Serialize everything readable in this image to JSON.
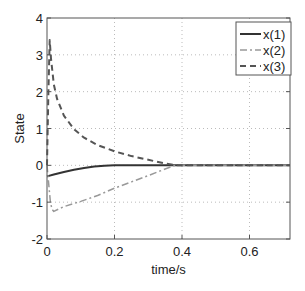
{
  "chart_data": {
    "type": "line",
    "title": "",
    "xlabel": "time/s",
    "ylabel": "State",
    "xlim": [
      0,
      0.72
    ],
    "ylim": [
      -2,
      4
    ],
    "xticks": [
      0,
      0.2,
      0.4,
      0.6
    ],
    "xtick_labels": [
      "0",
      "0.2",
      "0.4",
      "0.6"
    ],
    "yticks": [
      -2,
      -1,
      0,
      1,
      2,
      3,
      4
    ],
    "ytick_labels": [
      "-2",
      "-1",
      "0",
      "1",
      "2",
      "3",
      "4"
    ],
    "grid": true,
    "legend_position": "upper right",
    "series": [
      {
        "name": "x(1)",
        "style": "solid",
        "color": "#333333",
        "x": [
          0,
          0.02,
          0.05,
          0.08,
          0.11,
          0.14,
          0.17,
          0.2,
          0.25,
          0.3,
          0.4,
          0.5,
          0.6,
          0.72
        ],
        "y": [
          -0.3,
          -0.25,
          -0.18,
          -0.12,
          -0.07,
          -0.03,
          -0.01,
          0,
          0,
          0,
          0,
          0,
          0,
          0
        ]
      },
      {
        "name": "x(2)",
        "style": "dashdot",
        "color": "#999999",
        "x": [
          0,
          0.005,
          0.01,
          0.015,
          0.02,
          0.05,
          0.1,
          0.15,
          0.2,
          0.25,
          0.3,
          0.35,
          0.38,
          0.45,
          0.6,
          0.72
        ],
        "y": [
          0,
          -0.5,
          -1.0,
          -1.2,
          -1.25,
          -1.12,
          -0.98,
          -0.82,
          -0.62,
          -0.45,
          -0.28,
          -0.1,
          0,
          0,
          0,
          0
        ]
      },
      {
        "name": "x(3)",
        "style": "dashed",
        "color": "#555555",
        "x": [
          0,
          0.004,
          0.008,
          0.012,
          0.02,
          0.03,
          0.05,
          0.08,
          0.11,
          0.15,
          0.2,
          0.25,
          0.3,
          0.35,
          0.38,
          0.45,
          0.6,
          0.72
        ],
        "y": [
          0,
          2.0,
          3.4,
          2.9,
          2.2,
          1.8,
          1.35,
          0.98,
          0.75,
          0.55,
          0.38,
          0.25,
          0.15,
          0.05,
          0,
          0,
          0,
          0
        ]
      }
    ]
  },
  "legend": {
    "items": [
      "x(1)",
      "x(2)",
      "x(3)"
    ]
  }
}
